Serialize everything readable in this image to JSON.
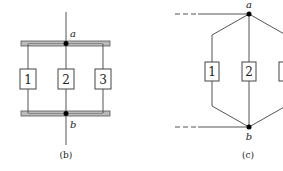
{
  "figure_b": {
    "caption": "(b)",
    "node_top": "a",
    "node_bottom": "b",
    "components": [
      "1",
      "2",
      "3"
    ]
  },
  "figure_c": {
    "caption": "(c)",
    "node_top": "a",
    "node_bottom": "b",
    "components": [
      "1",
      "2",
      "3"
    ]
  },
  "colors": {
    "line": "#555555",
    "bar_fill": "#bbbbbb",
    "node": "#000000"
  }
}
